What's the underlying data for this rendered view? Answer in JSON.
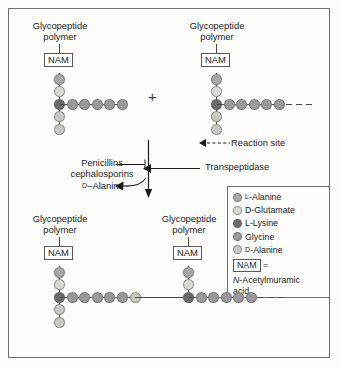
{
  "figure": {
    "colors": {
      "l_alanine": "#a8a8a8",
      "d_glutamate": "#d9d9d4",
      "l_lysine": "#6b6b6b",
      "glycine": "#9a9a9a",
      "d_alanine": "#c9c9c4",
      "line": "#4a4a4a",
      "border": "#6e6e6e",
      "text": "#1b1b1b",
      "background": "#fdfdfc"
    },
    "top_left_unit": {
      "header_line1": "Glycopeptide",
      "header_line2": "polymer",
      "nam_label": "NAM",
      "vertical_chain": [
        "l_alanine",
        "d_glutamate",
        "l_lysine",
        "d_alanine",
        "d_alanine"
      ],
      "horizontal_chain": [
        "glycine",
        "glycine",
        "glycine",
        "glycine",
        "glycine"
      ],
      "trailing_dashes": 0
    },
    "top_right_unit": {
      "header_line1": "Glycopeptide",
      "header_line2": "polymer",
      "nam_label": "NAM",
      "vertical_chain": [
        "l_alanine",
        "d_glutamate",
        "l_lysine",
        "d_alanine",
        "d_alanine"
      ],
      "horizontal_chain": [
        "glycine",
        "glycine",
        "glycine",
        "glycine",
        "glycine"
      ],
      "trailing_dashes": 3
    },
    "bottom_left_unit": {
      "header_line1": "Glycopeptide",
      "header_line2": "polymer",
      "nam_label": "NAM",
      "vertical_chain": [
        "l_alanine",
        "d_glutamate",
        "l_lysine",
        "d_alanine",
        "d_alanine"
      ],
      "horizontal_chain": [
        "glycine",
        "glycine",
        "glycine",
        "glycine",
        "glycine",
        "d_alanine"
      ]
    },
    "bottom_right_unit": {
      "header_line1": "Glycopeptide",
      "header_line2": "polymer",
      "nam_label": "NAM",
      "vertical_chain": [
        "l_alanine",
        "d_glutamate",
        "l_lysine"
      ],
      "horizontal_chain": [
        "glycine",
        "glycine",
        "glycine",
        "glycine",
        "glycine"
      ],
      "trailing_dashes": 3
    },
    "plus_symbol": "+",
    "annotations": {
      "reaction_site": "Reaction site",
      "transpeptidase": "Transpeptidase",
      "inhibitors_line1": "Penicillins",
      "inhibitors_line2": "cephalosporins",
      "released_product": "D–Alanine",
      "released_product_sc": "D"
    },
    "legend": {
      "items": [
        {
          "label": "Alanine",
          "prefix": "L",
          "prefix_smallcaps": true,
          "color_key": "l_alanine"
        },
        {
          "label": "D-Glutamate",
          "prefix": "",
          "prefix_smallcaps": false,
          "color_key": "d_glutamate"
        },
        {
          "label": "L-Lysine",
          "prefix": "",
          "prefix_smallcaps": false,
          "color_key": "l_lysine"
        },
        {
          "label": "Glycine",
          "prefix": "",
          "prefix_smallcaps": false,
          "color_key": "glycine"
        },
        {
          "label": "Alanine",
          "prefix": "D",
          "prefix_smallcaps": true,
          "color_key": "d_alanine"
        }
      ],
      "nam_key": "NAM",
      "nam_equals": "=",
      "nam_definition_italic": "N",
      "nam_definition_line1": "-Acetylmuramic",
      "nam_definition_line2": "acid"
    }
  }
}
